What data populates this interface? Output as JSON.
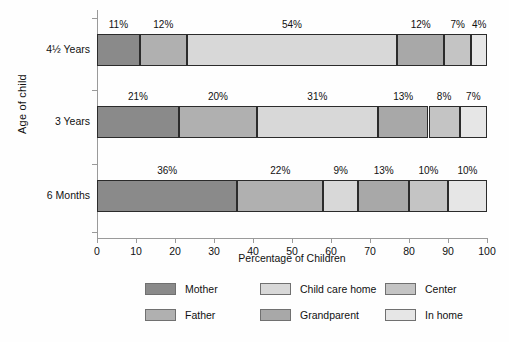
{
  "chart_data": {
    "type": "bar",
    "variant": "stacked-horizontal-100",
    "title": "",
    "xlabel": "Percentage of Children",
    "ylabel": "Age of child",
    "xlim": [
      0,
      100
    ],
    "xticks": [
      "0",
      "10",
      "20",
      "30",
      "40",
      "50",
      "60",
      "70",
      "80",
      "90",
      "100"
    ],
    "grid": false,
    "legend_position": "bottom",
    "categories": [
      "4½ Years",
      "3 Years",
      "6 Months"
    ],
    "series": [
      {
        "name": "Mother",
        "color": "#8a8a8a",
        "values": [
          11,
          21,
          36
        ]
      },
      {
        "name": "Father",
        "color": "#b0b0b0",
        "values": [
          12,
          20,
          22
        ]
      },
      {
        "name": "Child care home",
        "color": "#d8d8d8",
        "values": [
          54,
          31,
          9
        ]
      },
      {
        "name": "Grandparent",
        "color": "#a8a8a8",
        "values": [
          12,
          13,
          13
        ]
      },
      {
        "name": "Center",
        "color": "#c4c4c4",
        "values": [
          7,
          8,
          10
        ]
      },
      {
        "name": "In home",
        "color": "#e6e6e6",
        "values": [
          4,
          7,
          10
        ]
      }
    ],
    "bars": [
      {
        "category": "4½ Years",
        "segments": [
          {
            "series": "Mother",
            "value": 11,
            "label": "11%"
          },
          {
            "series": "Father",
            "value": 12,
            "label": "12%"
          },
          {
            "series": "Child care home",
            "value": 54,
            "label": "54%"
          },
          {
            "series": "Grandparent",
            "value": 12,
            "label": "12%"
          },
          {
            "series": "Center",
            "value": 7,
            "label": "7%"
          },
          {
            "series": "In home",
            "value": 4,
            "label": "4%"
          }
        ]
      },
      {
        "category": "3 Years",
        "segments": [
          {
            "series": "Mother",
            "value": 21,
            "label": "21%"
          },
          {
            "series": "Father",
            "value": 20,
            "label": "20%"
          },
          {
            "series": "Child care home",
            "value": 31,
            "label": "31%"
          },
          {
            "series": "Grandparent",
            "value": 13,
            "label": "13%"
          },
          {
            "series": "Center",
            "value": 8,
            "label": "8%"
          },
          {
            "series": "In home",
            "value": 7,
            "label": "7%"
          }
        ]
      },
      {
        "category": "6 Months",
        "segments": [
          {
            "series": "Mother",
            "value": 36,
            "label": "36%"
          },
          {
            "series": "Father",
            "value": 22,
            "label": "22%"
          },
          {
            "series": "Child care home",
            "value": 9,
            "label": "9%"
          },
          {
            "series": "Grandparent",
            "value": 13,
            "label": "13%"
          },
          {
            "series": "Center",
            "value": 10,
            "label": "10%"
          },
          {
            "series": "In home",
            "value": 10,
            "label": "10%"
          }
        ]
      }
    ]
  },
  "axes": {
    "y_title": "Age of child",
    "x_title": "Percentage of Children"
  },
  "legend": {
    "entries": [
      {
        "label": "Mother",
        "color": "#8a8a8a"
      },
      {
        "label": "Child care home",
        "color": "#d8d8d8"
      },
      {
        "label": "Center",
        "color": "#c4c4c4"
      },
      {
        "label": "Father",
        "color": "#b0b0b0"
      },
      {
        "label": "Grandparent",
        "color": "#a8a8a8"
      },
      {
        "label": "In home",
        "color": "#e6e6e6"
      }
    ]
  }
}
